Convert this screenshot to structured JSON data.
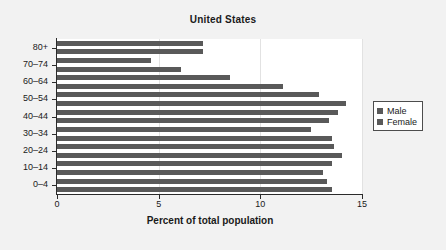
{
  "figure": {
    "background_color": "#f2f2f2",
    "plot_background_color": "#ffffff",
    "axis_color": "#2b2b2b"
  },
  "legend": {
    "position": "right",
    "entries": [
      {
        "label": "Male",
        "color": "#595959"
      },
      {
        "label": "Female",
        "color": "#595959"
      }
    ]
  },
  "chart_data": {
    "type": "bar",
    "orientation": "horizontal",
    "title": "United States",
    "xlabel": "Percent of total population",
    "ylabel": "",
    "xlim": [
      0,
      15
    ],
    "ylim": [
      0,
      18
    ],
    "xticks": [
      0,
      5,
      10,
      15
    ],
    "xticklabels": [
      "0",
      "5",
      "10",
      "15"
    ],
    "grid": true,
    "grid_axis": "x",
    "categories": [
      "0–4",
      "10–14",
      "20–24",
      "30–34",
      "40–44",
      "50–54",
      "60–64",
      "70–74",
      "80+"
    ],
    "legend_position": "right",
    "bar_color": "#595959",
    "series": [
      {
        "name": "Male",
        "color": "#595959",
        "values": [
          13.5,
          13.1,
          14.0,
          13.5,
          13.4,
          14.2,
          11.1,
          6.1,
          7.2
        ]
      },
      {
        "name": "Female",
        "color": "#595959",
        "values": [
          13.3,
          13.3,
          13.5,
          13.6,
          12.5,
          13.8,
          12.9,
          8.5,
          4.6
        ]
      }
    ],
    "bars_bottom_to_top": [
      {
        "category": "0–4",
        "series": "Male",
        "value": 13.5
      },
      {
        "category": "0–4",
        "series": "Female",
        "value": 13.3
      },
      {
        "category": "10–14",
        "series": "Male",
        "value": 13.1
      },
      {
        "category": "10–14",
        "series": "Female",
        "value": 13.5
      },
      {
        "category": "20–24",
        "series": "Male",
        "value": 14.0
      },
      {
        "category": "20–24",
        "series": "Female",
        "value": 13.6
      },
      {
        "category": "30–34",
        "series": "Male",
        "value": 13.5
      },
      {
        "category": "30–34",
        "series": "Female",
        "value": 12.5
      },
      {
        "category": "40–44",
        "series": "Male",
        "value": 13.4
      },
      {
        "category": "40–44",
        "series": "Female",
        "value": 13.8
      },
      {
        "category": "50–54",
        "series": "Male",
        "value": 14.2
      },
      {
        "category": "50–54",
        "series": "Female",
        "value": 12.9
      },
      {
        "category": "60–64",
        "series": "Male",
        "value": 11.1
      },
      {
        "category": "60–64",
        "series": "Female",
        "value": 8.5
      },
      {
        "category": "70–74",
        "series": "Male",
        "value": 6.1
      },
      {
        "category": "70–74",
        "series": "Female",
        "value": 4.6
      },
      {
        "category": "80+",
        "series": "Male",
        "value": 7.2
      },
      {
        "category": "80+",
        "series": "Female",
        "value": 7.2
      }
    ]
  }
}
